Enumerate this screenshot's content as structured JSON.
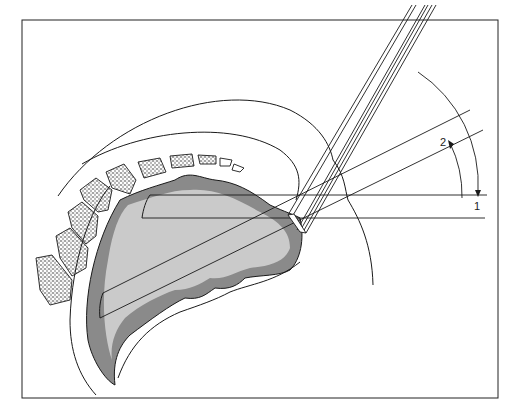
{
  "figure": {
    "type": "anatomical line illustration",
    "labels": {
      "axis_1": "1",
      "axis_2": "2"
    },
    "colors": {
      "line": "#1a1a1a",
      "tissue_shade": "#8a8a8a",
      "bone_stipple": "#333333",
      "background": "#ffffff"
    }
  }
}
